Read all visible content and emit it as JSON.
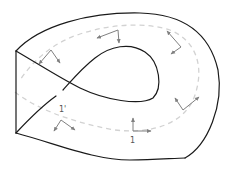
{
  "diagram": {
    "colors": {
      "edge": "#1a1a1a",
      "path": "#d2d2d2",
      "frame": "#808080",
      "background": "#ffffff"
    },
    "labels": {
      "start_frame": "1",
      "end_frame": "1'"
    },
    "frames": [
      {
        "id": "frame-1",
        "origin": [
          133,
          131
        ],
        "a": [
          133,
          118
        ],
        "b": [
          151,
          131
        ],
        "label": "1"
      },
      {
        "id": "frame-2",
        "origin": [
          183,
          110
        ],
        "a": [
          175,
          98
        ],
        "b": [
          199,
          97
        ]
      },
      {
        "id": "frame-3",
        "origin": [
          181,
          47
        ],
        "a": [
          167,
          31
        ],
        "b": [
          171,
          54
        ]
      },
      {
        "id": "frame-4",
        "origin": [
          118,
          30
        ],
        "a": [
          97,
          38
        ],
        "b": [
          119,
          43
        ]
      },
      {
        "id": "frame-5",
        "origin": [
          51,
          50
        ],
        "a": [
          39,
          64
        ],
        "b": [
          60,
          63
        ]
      },
      {
        "id": "frame-6",
        "origin": [
          61,
          120
        ],
        "a": [
          54,
          131
        ],
        "b": [
          75,
          130
        ],
        "label": "1'"
      }
    ]
  }
}
